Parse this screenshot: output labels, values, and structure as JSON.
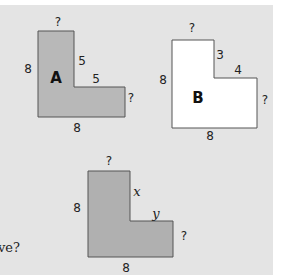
{
  "question_fragment": "ve?",
  "colors": {
    "panel": "#e4e4e4",
    "shape_gray": "#b8b8b8",
    "shape_white": "#ffffff",
    "stroke": "#555555"
  },
  "shapes": [
    {
      "id": "A",
      "name": "A",
      "fill": "gray",
      "labels": {
        "top": "?",
        "left": "8",
        "inner_vertical": "5",
        "inner_horizontal": "5",
        "right": "?",
        "bottom": "8"
      }
    },
    {
      "id": "B",
      "name": "B",
      "fill": "white",
      "labels": {
        "top": "?",
        "left": "8",
        "inner_vertical": "3",
        "inner_horizontal": "4",
        "right": "?",
        "bottom": "8"
      }
    },
    {
      "id": "C",
      "name": "",
      "fill": "gray",
      "labels": {
        "top": "?",
        "left": "8",
        "inner_vertical": "x",
        "inner_horizontal": "y",
        "right": "?",
        "bottom": "8"
      }
    }
  ]
}
